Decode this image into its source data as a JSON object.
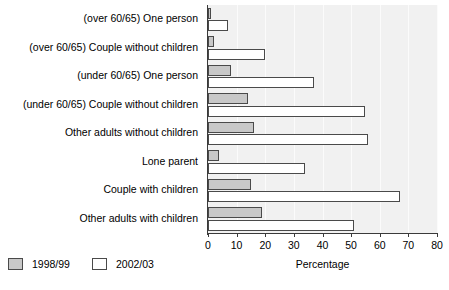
{
  "chart_data": {
    "type": "bar",
    "title": "",
    "subtitle": "",
    "orientation": "horizontal",
    "xlabel": "Percentage",
    "ylabel": "",
    "xlim": [
      0,
      80
    ],
    "xticks": [
      0,
      10,
      20,
      30,
      40,
      50,
      60,
      70,
      80
    ],
    "xtick_labels": [
      "0",
      "10",
      "20",
      "30",
      "40",
      "50",
      "60",
      "70",
      "80"
    ],
    "grid": true,
    "legend_position": "bottom-left",
    "categories": [
      "(over 60/65) One person",
      "(over 60/65) Couple without children",
      "(under 60/65) One person",
      "(under 60/65) Couple without children",
      "Other adults without children",
      "Lone parent",
      "Couple with children",
      "Other adults with children"
    ],
    "series": [
      {
        "name": "1998/99",
        "color": "#c8c8c8",
        "values": [
          1,
          2,
          8,
          14,
          16,
          4,
          15,
          19
        ]
      },
      {
        "name": "2002/03",
        "color": "#ffffff",
        "values": [
          7,
          20,
          37,
          55,
          56,
          34,
          67,
          51
        ]
      }
    ]
  },
  "legend": {
    "items": [
      {
        "label": "1998/99",
        "color": "#c8c8c8"
      },
      {
        "label": "2002/03",
        "color": "#ffffff"
      }
    ]
  },
  "axis": {
    "x_title": "Percentage"
  },
  "colors": {
    "plot_background": "#f1f1f1",
    "gridline": "#fbfbfb",
    "axis_line": "#3a3a3a",
    "bar_border": "#4a4a4a",
    "text": "#000000"
  }
}
